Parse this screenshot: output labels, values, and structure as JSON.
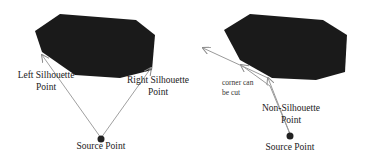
{
  "figure": {
    "left_panel": {
      "labels": {
        "left_silhouette_line1": "Left Silhouette",
        "left_silhouette_line2": "Point",
        "right_silhouette_line1": "Right Silhouette",
        "right_silhouette_line2": "Point",
        "source": "Source Point"
      }
    },
    "right_panel": {
      "labels": {
        "corner_line1": "corner can",
        "corner_line2": "be cut",
        "non_silhouette_line1": "Non-Silhouette",
        "non_silhouette_line2": "Point",
        "source": "Source Point"
      }
    },
    "colors": {
      "obstacle": "#1a1a1a",
      "ray": "#9a9a9a",
      "source": "#222222",
      "text": "#222222"
    }
  }
}
